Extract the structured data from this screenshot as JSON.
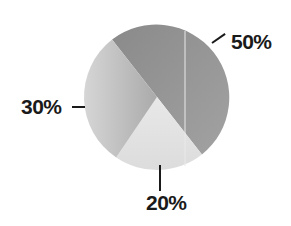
{
  "chart_data": {
    "type": "pie",
    "title": "",
    "slices": [
      {
        "label": "50%",
        "value": 50,
        "color": "#939393"
      },
      {
        "label": "20%",
        "value": 20,
        "color": "#e2e2e2"
      },
      {
        "label": "30%",
        "value": 30,
        "color": "#c4c4c4"
      }
    ],
    "start_angle_deg": 322,
    "direction": "clockwise",
    "legend": "none",
    "data_labels": [
      "50%",
      "20%",
      "30%"
    ]
  },
  "labels": {
    "a": "50%",
    "b": "20%",
    "c": "30%"
  }
}
